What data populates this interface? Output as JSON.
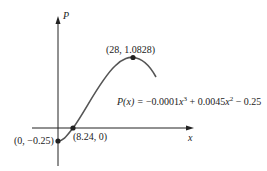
{
  "axes": {
    "x_label": "x",
    "y_label": "P"
  },
  "points": [
    {
      "label": "(0, −0.25)",
      "x": 0,
      "y": -0.25
    },
    {
      "label": "(8.24, 0)",
      "x": 8.24,
      "y": 0
    },
    {
      "label": "(28, 1.0828)",
      "x": 28,
      "y": 1.0828
    }
  ],
  "equation": {
    "lhs": "P(x) = ",
    "t1": "−0.0001",
    "t1_var": "x",
    "t1_exp": "3",
    "t2": " + 0.0045",
    "t2_var": "x",
    "t2_exp": "2",
    "t3": " − 0.25"
  },
  "colors": {
    "curve": "#555555",
    "axes": "#222222",
    "points": "#222222"
  }
}
